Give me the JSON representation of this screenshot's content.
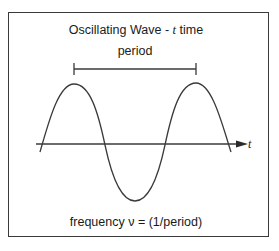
{
  "diagram": {
    "title_prefix": "Oscillating Wave - ",
    "title_var": "t",
    "title_suffix": " time",
    "period_label": "period",
    "axis_label": "t",
    "frequency_label": "frequency ν = (1/period)"
  },
  "geometry": {
    "frame": {
      "x": 8,
      "y": 12,
      "w": 261,
      "h": 225
    },
    "axis": {
      "x1": 36,
      "x2": 248,
      "y": 144
    },
    "wave": {
      "x_start": 40,
      "x_end": 231,
      "peak1_x": 74,
      "peak2_x": 196,
      "trough_x": 135,
      "peak_y": 84,
      "trough_y": 201
    },
    "period_bracket": {
      "x1": 74,
      "x2": 196,
      "y": 69
    }
  },
  "colors": {
    "line": "#3a3a3a",
    "text": "#1a1a1a",
    "background": "#ffffff"
  }
}
